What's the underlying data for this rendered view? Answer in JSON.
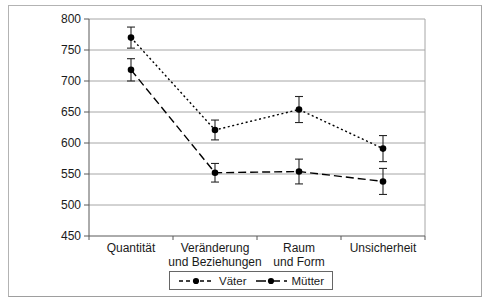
{
  "figure": {
    "background": "#ffffff",
    "border_color": "#b3b3b3"
  },
  "chart_data": {
    "type": "line",
    "title": "",
    "xlabel": "",
    "ylabel": "",
    "categories": [
      "Quantität",
      "Veränderung\nund Beziehungen",
      "Raum\nund Form",
      "Unsicherheit"
    ],
    "series": [
      {
        "name": "Väter",
        "line_style": "dotted",
        "marker": "filled-circle",
        "values": [
          770,
          621,
          654,
          591
        ],
        "error_bars": [
          17,
          16,
          21,
          21
        ]
      },
      {
        "name": "Mütter",
        "line_style": "dashed",
        "marker": "filled-circle",
        "values": [
          718,
          552,
          554,
          538
        ],
        "error_bars": [
          18,
          15,
          20,
          21
        ]
      }
    ],
    "ylim": [
      450,
      800
    ],
    "yticks": [
      450,
      500,
      550,
      600,
      650,
      700,
      750,
      800
    ],
    "grid": true,
    "legend_position": "bottom-center",
    "colors": {
      "series": "#000000",
      "grid": "#a6a6a6",
      "axis": "#595959",
      "text": "#1a1a1a",
      "figure_border": "#b3b3b3"
    }
  }
}
